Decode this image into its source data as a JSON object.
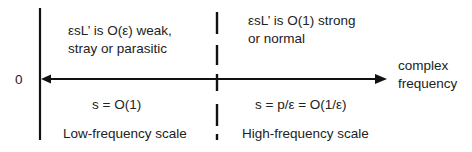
{
  "diagram": {
    "origin_label": "0",
    "axis_label_line1": "complex",
    "axis_label_line2": "frequency",
    "regions": {
      "low": {
        "description_line1": "εsL’ is O(ε) weak,",
        "description_line2": "stray or parasitic",
        "equation": "s = O(1)",
        "scale_label": "Low-frequency scale"
      },
      "high": {
        "description_line1": "εsL’ is O(1) strong",
        "description_line2": "or normal",
        "equation": "s = p/ε = O(1/ε)",
        "scale_label": "High-frequency scale"
      }
    },
    "colors": {
      "line": "#111111",
      "text": "#222222",
      "background": "#ffffff"
    }
  }
}
